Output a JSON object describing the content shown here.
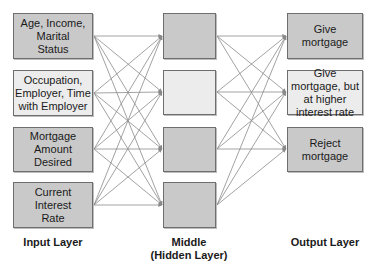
{
  "input_layer": {
    "label": "Input Layer",
    "nodes": [
      {
        "text": "Age, Income, Marital Status",
        "shade": "dark"
      },
      {
        "text": "Occupation, Employer, Time with Employer",
        "shade": "light"
      },
      {
        "text": "Mortgage Amount Desired",
        "shade": "dark"
      },
      {
        "text": "Current Interest Rate",
        "shade": "dark"
      }
    ]
  },
  "hidden_layer": {
    "label_line1": "Middle",
    "label_line2": "(Hidden Layer)",
    "nodes": [
      {
        "text": "",
        "shade": "dark"
      },
      {
        "text": "",
        "shade": "light"
      },
      {
        "text": "",
        "shade": "dark"
      },
      {
        "text": "",
        "shade": "dark"
      }
    ]
  },
  "output_layer": {
    "label": "Output Layer",
    "nodes": [
      {
        "text": "Give mortgage",
        "shade": "dark"
      },
      {
        "text": "Give mortgage, but at higher interest rate",
        "shade": "light"
      },
      {
        "text": "Reject mortgage",
        "shade": "dark"
      }
    ]
  },
  "colors": {
    "edge": "#8a8a8a",
    "dark_node": "#c9c9c9",
    "light_node": "#ececec",
    "border": "#6e6e6e"
  }
}
